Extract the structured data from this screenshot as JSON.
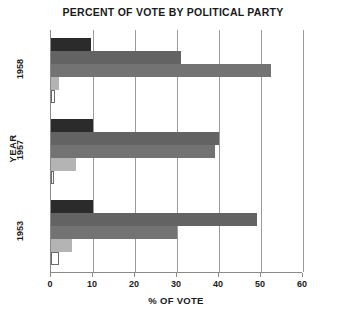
{
  "chart_data": {
    "type": "bar",
    "orientation": "horizontal",
    "title": "PERCENT OF VOTE BY POLITICAL PARTY",
    "xlabel": "% OF VOTE",
    "ylabel": "YEAR",
    "categories": [
      "1958",
      "1957",
      "1953"
    ],
    "xlim": [
      0,
      60
    ],
    "xticks": [
      0,
      10,
      20,
      30,
      40,
      50,
      60
    ],
    "xticklabels": [
      "0",
      "10",
      "20",
      "30",
      "40",
      "50",
      "60"
    ],
    "grid": "vertical",
    "legend": "none",
    "series": [
      {
        "name": "series-1",
        "color": "#2b2b2b",
        "values": [
          9.5,
          10.0,
          10.0
        ]
      },
      {
        "name": "series-2",
        "color": "#636363",
        "values": [
          31.0,
          40.0,
          49.0
        ]
      },
      {
        "name": "series-3",
        "color": "#737373",
        "values": [
          52.3,
          39.0,
          30.0
        ]
      },
      {
        "name": "series-4",
        "color": "#b4b4b4",
        "values": [
          2.0,
          6.0,
          5.0
        ]
      },
      {
        "name": "series-5",
        "color": "#ffffff",
        "values": [
          1.0,
          0.6,
          2.0
        ]
      }
    ]
  }
}
